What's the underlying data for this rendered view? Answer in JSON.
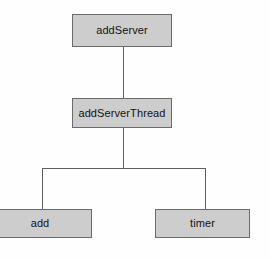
{
  "diagram": {
    "background_color": "#fefefe",
    "node_fill_color": "#cdcdcd",
    "node_border_color": "#6b6b6b",
    "edge_color": "#5e5e5e",
    "text_color": "#111111",
    "nodes": [
      {
        "id": "addServer",
        "label": "addServer",
        "level": 0
      },
      {
        "id": "addServerThread",
        "label": "addServerThread",
        "level": 1
      },
      {
        "id": "add",
        "label": "add",
        "level": 2
      },
      {
        "id": "timer",
        "label": "timer",
        "level": 2
      }
    ],
    "edges": [
      {
        "from": "addServer",
        "to": "addServerThread"
      },
      {
        "from": "addServerThread",
        "to": "add"
      },
      {
        "from": "addServerThread",
        "to": "timer"
      }
    ]
  }
}
